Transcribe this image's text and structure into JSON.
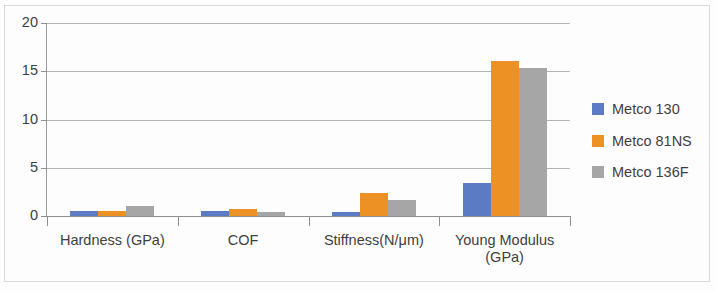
{
  "chart_data": {
    "type": "bar",
    "title": "",
    "subtitle": "",
    "xlabel": "",
    "ylabel": "",
    "categories": [
      "Hardness (GPa)",
      "COF",
      "Stiffness(N/μm)",
      "Young Modulus (GPa)"
    ],
    "category_lines": [
      [
        "Hardness (GPa)"
      ],
      [
        "COF"
      ],
      [
        "Stiffness(N/μm)"
      ],
      [
        "Young Modulus",
        "(GPa)"
      ]
    ],
    "series": [
      {
        "name": "Metco 130",
        "color": "#5b7bc4",
        "values": [
          0.5,
          0.5,
          0.45,
          3.4
        ]
      },
      {
        "name": "Metco 81NS",
        "color": "#ed9125",
        "values": [
          0.5,
          0.7,
          2.4,
          16.1
        ]
      },
      {
        "name": "Metco 136F",
        "color": "#a6a6a6",
        "values": [
          1.05,
          0.4,
          1.65,
          15.3
        ]
      }
    ],
    "ylim": [
      0,
      20
    ],
    "yticks": [
      0,
      5,
      10,
      15,
      20
    ],
    "ytick_labels": [
      "0",
      "5",
      "10",
      "15",
      "20"
    ],
    "grid": true,
    "grid_axis": "y",
    "legend_position": "right",
    "colors": {
      "series_1": "#5b7bc4",
      "series_2": "#ed9125",
      "series_3": "#a6a6a6",
      "gridline": "#b3b3b3",
      "axis": "#8f8f8f",
      "text": "#3f3f3f",
      "background": "#fdfdfd"
    }
  }
}
